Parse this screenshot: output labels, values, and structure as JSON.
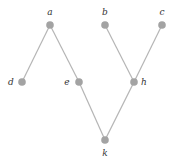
{
  "diagram": {
    "type": "graph",
    "colors": {
      "edge": "#b5b5b5",
      "node": "#a3a3a3",
      "label": "#333333"
    },
    "nodes": [
      {
        "id": "a",
        "label": "a",
        "x": 50,
        "y": 25,
        "lx": 50,
        "ly": 15
      },
      {
        "id": "b",
        "label": "b",
        "x": 105,
        "y": 25,
        "lx": 105,
        "ly": 15
      },
      {
        "id": "c",
        "label": "c",
        "x": 162,
        "y": 25,
        "lx": 162,
        "ly": 15
      },
      {
        "id": "d",
        "label": "d",
        "x": 22,
        "y": 82,
        "lx": 11,
        "ly": 85
      },
      {
        "id": "e",
        "label": "e",
        "x": 79,
        "y": 82,
        "lx": 67,
        "ly": 85
      },
      {
        "id": "h",
        "label": "h",
        "x": 134,
        "y": 82,
        "lx": 144,
        "ly": 85
      },
      {
        "id": "k",
        "label": "k",
        "x": 105,
        "y": 140,
        "lx": 105,
        "ly": 156
      }
    ],
    "edges": [
      {
        "from": "a",
        "to": "d"
      },
      {
        "from": "a",
        "to": "e"
      },
      {
        "from": "e",
        "to": "k"
      },
      {
        "from": "b",
        "to": "h"
      },
      {
        "from": "c",
        "to": "h"
      },
      {
        "from": "h",
        "to": "k"
      }
    ]
  }
}
